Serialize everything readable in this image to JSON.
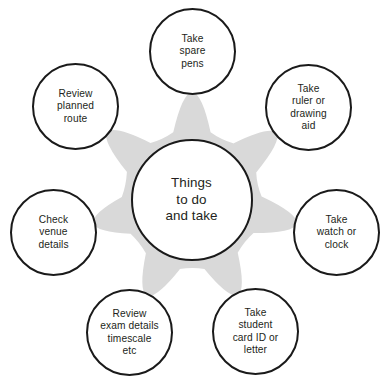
{
  "diagram": {
    "type": "hub-and-spoke-star",
    "title_shown_in_hub": "Things to do and take",
    "background_color": "#ffffff",
    "star_color": "#d9d9d9",
    "node_border_color": "#1a1a1a",
    "node_fill_color": "#ffffff",
    "text_color": "#231f20",
    "point_count": 7
  },
  "center": {
    "name": "things-to-do-and-take",
    "label": "Things\nto do\nand take",
    "cx": 191.5,
    "cy": 200,
    "r": 61
  },
  "nodes": [
    {
      "name": "take-spare-pens",
      "label": "Take\nspare\npens",
      "cx": 192.5,
      "cy": 51.5,
      "r": 43.5,
      "angle_deg": -90
    },
    {
      "name": "take-ruler-or-drawing-aid",
      "label": "Take\nruler or\ndrawing\naid",
      "cx": 308.5,
      "cy": 107.5,
      "r": 43.5,
      "angle_deg": -38.6
    },
    {
      "name": "take-watch-or-clock",
      "label": "Take\nwatch or\nclock",
      "cx": 336.5,
      "cy": 232.5,
      "r": 43.5,
      "angle_deg": 12.9
    },
    {
      "name": "take-student-card-id-or-letter",
      "label": "Take\nstudent\ncard ID or\nletter",
      "cx": 255.5,
      "cy": 331.5,
      "r": 43.5,
      "angle_deg": 64.3
    },
    {
      "name": "review-exam-details-timescale-etc",
      "label": "Review\nexam details\ntimescale\netc",
      "cx": 129.5,
      "cy": 332.5,
      "r": 43.5,
      "angle_deg": 115.7
    },
    {
      "name": "check-venue-details",
      "label": "Check\nvenue\ndetails",
      "cx": 53.5,
      "cy": 232.5,
      "r": 43.5,
      "angle_deg": 167.1
    },
    {
      "name": "review-planned-route",
      "label": "Review\nplanned\nroute",
      "cx": 75.5,
      "cy": 106.5,
      "r": 43.5,
      "angle_deg": -141.4
    }
  ]
}
